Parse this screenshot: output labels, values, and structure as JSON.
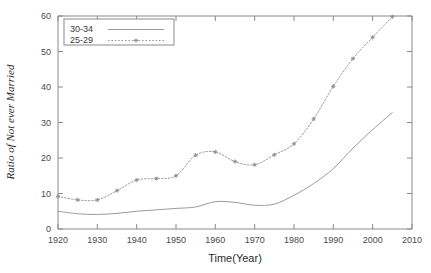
{
  "chart_data": {
    "type": "line",
    "title": "",
    "xlabel": "Time(Year)",
    "ylabel": "Ratio of Not ever Married",
    "xlim": [
      1920,
      2010
    ],
    "ylim": [
      0,
      60
    ],
    "xticks": [
      1920,
      1930,
      1940,
      1950,
      1960,
      1970,
      1980,
      1990,
      2000,
      2010
    ],
    "yticks": [
      0,
      10,
      20,
      30,
      40,
      50,
      60
    ],
    "grid": false,
    "legend_position": "top-left",
    "series": [
      {
        "name": "30-34",
        "style": "solid",
        "markers": false,
        "color": "#9b9b9b",
        "x": [
          1920,
          1925,
          1930,
          1935,
          1940,
          1945,
          1950,
          1955,
          1960,
          1965,
          1970,
          1975,
          1980,
          1985,
          1990,
          1995,
          2000,
          2005
        ],
        "values": [
          5.0,
          4.3,
          4.1,
          4.4,
          5.0,
          5.4,
          5.8,
          6.2,
          7.7,
          7.5,
          6.7,
          7.0,
          9.5,
          12.8,
          17.0,
          22.8,
          28.0,
          32.8
        ]
      },
      {
        "name": "25-29",
        "style": "dotted",
        "markers": true,
        "color": "#9b9b9b",
        "x": [
          1920,
          1925,
          1930,
          1935,
          1940,
          1945,
          1950,
          1955,
          1960,
          1965,
          1970,
          1975,
          1980,
          1985,
          1990,
          1995,
          2000,
          2005
        ],
        "values": [
          9.2,
          8.2,
          8.2,
          10.8,
          13.8,
          14.2,
          15.0,
          20.8,
          21.7,
          19.0,
          18.1,
          20.9,
          24.0,
          31.0,
          40.2,
          48.0,
          54.0,
          59.8
        ]
      }
    ]
  },
  "legend": {
    "entries": [
      {
        "label": "30-34"
      },
      {
        "label": "25-29"
      }
    ]
  },
  "axes": {
    "x_title": "Time(Year)",
    "y_title": "Ratio of Not ever Married"
  }
}
